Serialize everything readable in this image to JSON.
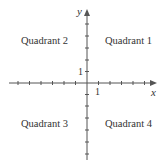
{
  "diagram": {
    "title": "",
    "axes": {
      "x_label": "x",
      "y_label": "y",
      "x_unit_label": "1",
      "y_unit_label": "1",
      "color": "#555555"
    },
    "quadrants": [
      {
        "id": 1,
        "label": "Quadrant 1"
      },
      {
        "id": 2,
        "label": "Quadrant 2"
      },
      {
        "id": 3,
        "label": "Quadrant 3"
      },
      {
        "id": 4,
        "label": "Quadrant 4"
      }
    ]
  }
}
